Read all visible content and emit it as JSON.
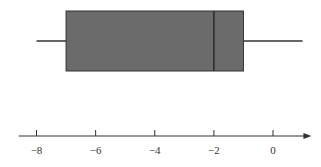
{
  "chart_data": {
    "type": "boxplot",
    "title": "",
    "xlabel": "",
    "ylabel": "",
    "orientation": "horizontal",
    "five_number_summary": {
      "min": -8,
      "q1": -7,
      "median": -2,
      "q3": -1,
      "max": 1
    },
    "axis": {
      "ticks": [
        -8,
        -6,
        -4,
        -2,
        0
      ],
      "tick_labels": [
        "−8",
        "−6",
        "−4",
        "−2",
        "0"
      ],
      "range": [
        -8.6,
        1.3
      ],
      "arrow": true,
      "grid": false
    },
    "legend": null
  },
  "colors": {
    "box_fill": "#6b6b6b",
    "stroke": "#333333",
    "background": "#ffffff"
  }
}
